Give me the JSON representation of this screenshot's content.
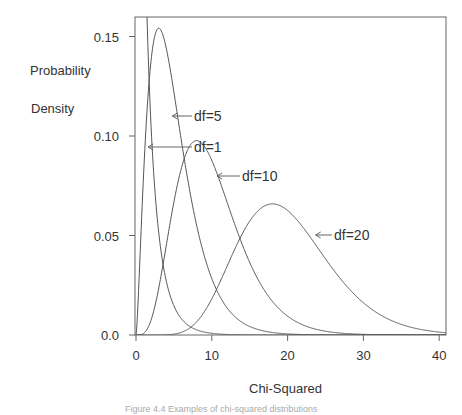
{
  "chart_data": {
    "type": "line",
    "title": "",
    "xlabel": "Chi-Squared",
    "ylabel": [
      "Probability",
      "Density"
    ],
    "xlim": [
      0,
      41
    ],
    "ylim": [
      0,
      0.16
    ],
    "x_ticks": [
      0,
      10,
      20,
      30,
      40
    ],
    "x_tick_labels": [
      "0",
      "10",
      "20",
      "30",
      "40"
    ],
    "y_ticks": [
      0,
      0.05,
      0.1,
      0.15
    ],
    "y_tick_labels": [
      "0.0",
      "0.05",
      "0.10",
      "0.15"
    ],
    "grid": false,
    "legend": "none (inline arrow annotations)",
    "series": [
      {
        "name": "df=1",
        "df": 1,
        "description": "chi-squared density, df=1, diverges near 0"
      },
      {
        "name": "df=5",
        "df": 5,
        "peak": {
          "x": 3,
          "y": 0.154
        }
      },
      {
        "name": "df=10",
        "df": 10,
        "peak": {
          "x": 8,
          "y": 0.098
        }
      },
      {
        "name": "df=20",
        "df": 20,
        "peak": {
          "x": 18,
          "y": 0.066
        }
      }
    ],
    "annotations": [
      {
        "text": "df=5",
        "arrow_to": {
          "x": 4.8,
          "y": 0.125
        }
      },
      {
        "text": "df=1",
        "arrow_to": {
          "x": 1.6,
          "y": 0.111
        }
      },
      {
        "text": "df=10",
        "arrow_to": {
          "x": 10.7,
          "y": 0.075
        }
      },
      {
        "text": "df=20",
        "arrow_to": {
          "x": 23.7,
          "y": 0.05
        }
      }
    ]
  },
  "labels": {
    "ylabel_line1": "Probability",
    "ylabel_line2": "Density",
    "xtitle": "Chi-Squared",
    "caption": "Figure 4.4 Examples of chi-squared distributions"
  }
}
